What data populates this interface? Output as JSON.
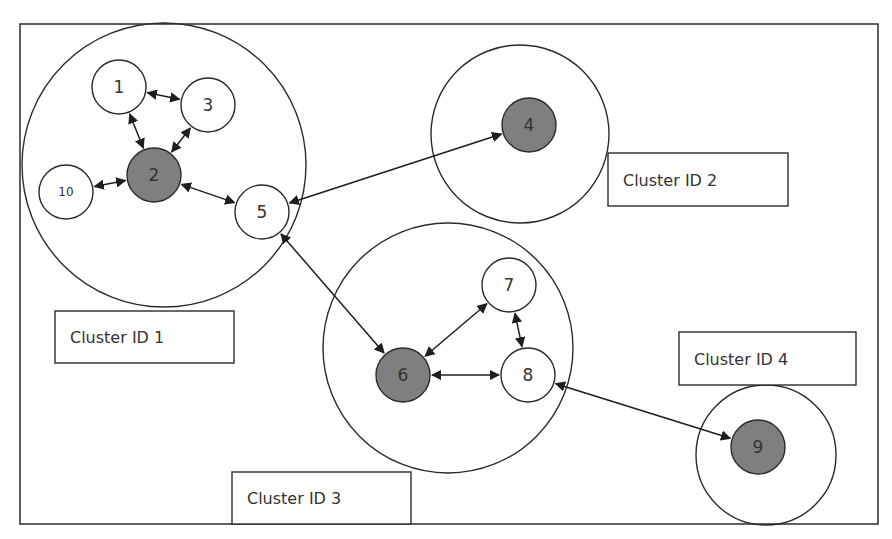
{
  "diagram": {
    "colors": {
      "stroke": "#2b2b2b",
      "leader_fill": "#7f7f7f",
      "node_fill": "#ffffff",
      "background": "#ffffff"
    },
    "clusters": [
      {
        "id": 1,
        "label": "Cluster ID 1",
        "cx": 164,
        "cy": 165,
        "r": 142,
        "box": {
          "x": 55,
          "y": 311,
          "w": 179,
          "h": 52
        }
      },
      {
        "id": 2,
        "label": "Cluster ID 2",
        "cx": 520,
        "cy": 134,
        "r": 89,
        "box": {
          "x": 608,
          "y": 153,
          "w": 180,
          "h": 53
        }
      },
      {
        "id": 3,
        "label": "Cluster ID 3",
        "cx": 448,
        "cy": 348,
        "r": 125,
        "box": {
          "x": 232,
          "y": 472,
          "w": 179,
          "h": 52
        }
      },
      {
        "id": 4,
        "label": "Cluster ID 4",
        "cx": 766,
        "cy": 455,
        "r": 70,
        "box": {
          "x": 679,
          "y": 332,
          "w": 177,
          "h": 53
        }
      }
    ],
    "nodes": [
      {
        "id": "1",
        "label": "1",
        "cx": 119,
        "cy": 87,
        "leader": false
      },
      {
        "id": "2",
        "label": "2",
        "cx": 154,
        "cy": 175,
        "leader": true
      },
      {
        "id": "3",
        "label": "3",
        "cx": 208,
        "cy": 105,
        "leader": false
      },
      {
        "id": "4",
        "label": "4",
        "cx": 529,
        "cy": 125,
        "leader": true
      },
      {
        "id": "5",
        "label": "5",
        "cx": 262,
        "cy": 212,
        "leader": false
      },
      {
        "id": "6",
        "label": "6",
        "cx": 403,
        "cy": 375,
        "leader": true
      },
      {
        "id": "7",
        "label": "7",
        "cx": 509,
        "cy": 285,
        "leader": false
      },
      {
        "id": "8",
        "label": "8",
        "cx": 528,
        "cy": 375,
        "leader": false
      },
      {
        "id": "9",
        "label": "9",
        "cx": 758,
        "cy": 447,
        "leader": true
      },
      {
        "id": "10",
        "label": "10",
        "cx": 66,
        "cy": 192,
        "leader": false
      }
    ],
    "edges": [
      {
        "from": "1",
        "to": "3",
        "bidirectional": true
      },
      {
        "from": "1",
        "to": "2",
        "bidirectional": true
      },
      {
        "from": "3",
        "to": "2",
        "bidirectional": true
      },
      {
        "from": "10",
        "to": "2",
        "bidirectional": true
      },
      {
        "from": "2",
        "to": "5",
        "bidirectional": true
      },
      {
        "from": "5",
        "to": "4",
        "bidirectional": true
      },
      {
        "from": "5",
        "to": "6",
        "bidirectional": true
      },
      {
        "from": "6",
        "to": "7",
        "bidirectional": true
      },
      {
        "from": "7",
        "to": "8",
        "bidirectional": true
      },
      {
        "from": "6",
        "to": "8",
        "bidirectional": true
      },
      {
        "from": "8",
        "to": "9",
        "bidirectional": true
      }
    ]
  }
}
